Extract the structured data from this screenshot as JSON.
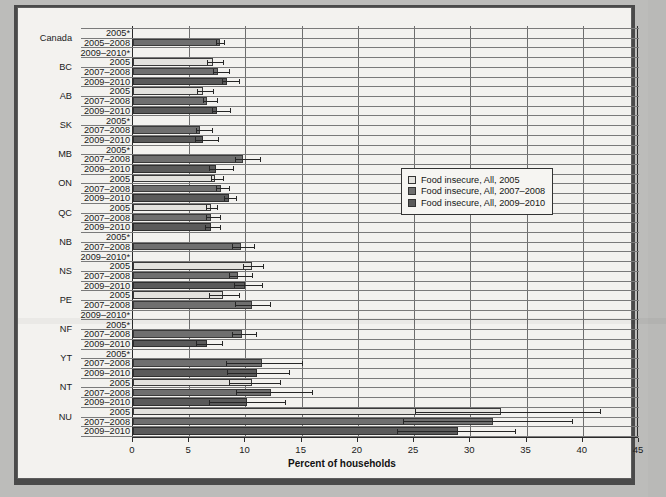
{
  "chart_data": {
    "type": "bar",
    "orientation": "horizontal",
    "title": "",
    "xlabel": "Percent of households",
    "ylabel": "",
    "xlim": [
      0,
      45
    ],
    "xticks": [
      0,
      5,
      10,
      15,
      20,
      25,
      30,
      35,
      40,
      45
    ],
    "grid": true,
    "legend_position": "upper right",
    "series": [
      {
        "name": "Food insecure, All, 2005",
        "color": "#e3e2de"
      },
      {
        "name": "Food insecure, All, 2007–2008",
        "color": "#6f6f6f"
      },
      {
        "name": "Food insecure, All, 2009–2010",
        "color": "#5a5a5a"
      }
    ],
    "note": "Rows marked with * have suppressed/unavailable estimates and show no bar.",
    "groups": [
      {
        "region": "Canada",
        "rows": [
          {
            "label": "2005*",
            "value": null,
            "ci_low": null,
            "ci_high": null,
            "series": 0
          },
          {
            "label": "2005–2008",
            "value": 7.7,
            "ci_low": 7.4,
            "ci_high": 8.1,
            "series": 1
          },
          {
            "label": "2009–2010*",
            "value": null,
            "ci_low": null,
            "ci_high": null,
            "series": 2
          }
        ]
      },
      {
        "region": "BC",
        "rows": [
          {
            "label": "2005",
            "value": 7.1,
            "ci_low": 6.6,
            "ci_high": 8.0,
            "series": 0
          },
          {
            "label": "2007–2008",
            "value": 7.6,
            "ci_low": 7.1,
            "ci_high": 8.5,
            "series": 1
          },
          {
            "label": "2009–2010",
            "value": 8.4,
            "ci_low": 7.9,
            "ci_high": 9.4,
            "series": 2
          }
        ]
      },
      {
        "region": "AB",
        "rows": [
          {
            "label": "2005",
            "value": 6.2,
            "ci_low": 5.7,
            "ci_high": 7.1,
            "series": 0
          },
          {
            "label": "2007–2008",
            "value": 6.6,
            "ci_low": 6.2,
            "ci_high": 7.5,
            "series": 1
          },
          {
            "label": "2009–2010",
            "value": 7.5,
            "ci_low": 7.0,
            "ci_high": 8.6,
            "series": 2
          }
        ]
      },
      {
        "region": "SK",
        "rows": [
          {
            "label": "2005*",
            "value": null,
            "ci_low": null,
            "ci_high": null,
            "series": 0
          },
          {
            "label": "2007–2008",
            "value": 6.0,
            "ci_low": 5.6,
            "ci_high": 7.0,
            "series": 1
          },
          {
            "label": "2009–2010",
            "value": 6.2,
            "ci_low": 5.5,
            "ci_high": 7.6,
            "series": 2
          }
        ]
      },
      {
        "region": "MB",
        "rows": [
          {
            "label": "2005*",
            "value": null,
            "ci_low": null,
            "ci_high": null,
            "series": 0
          },
          {
            "label": "2007–2008",
            "value": 9.8,
            "ci_low": 9.1,
            "ci_high": 11.3,
            "series": 1
          },
          {
            "label": "2009–2010",
            "value": 7.4,
            "ci_low": 6.8,
            "ci_high": 8.9,
            "series": 2
          }
        ]
      },
      {
        "region": "ON",
        "rows": [
          {
            "label": "2005",
            "value": 7.3,
            "ci_low": 6.9,
            "ci_high": 8.0,
            "series": 0
          },
          {
            "label": "2007–2008",
            "value": 7.8,
            "ci_low": 7.4,
            "ci_high": 8.5,
            "series": 1
          },
          {
            "label": "2009–2010",
            "value": 8.5,
            "ci_low": 8.1,
            "ci_high": 9.2,
            "series": 2
          }
        ]
      },
      {
        "region": "QC",
        "rows": [
          {
            "label": "2005",
            "value": 6.9,
            "ci_low": 6.5,
            "ci_high": 7.5,
            "series": 0
          },
          {
            "label": "2007–2008",
            "value": 6.9,
            "ci_low": 6.5,
            "ci_high": 7.7,
            "series": 1
          },
          {
            "label": "2009–2010",
            "value": 6.9,
            "ci_low": 6.4,
            "ci_high": 7.7,
            "series": 2
          }
        ]
      },
      {
        "region": "NB",
        "rows": [
          {
            "label": "2005*",
            "value": null,
            "ci_low": null,
            "ci_high": null,
            "series": 0
          },
          {
            "label": "2007–2008",
            "value": 9.6,
            "ci_low": 8.8,
            "ci_high": 10.8,
            "series": 1
          },
          {
            "label": "2009–2010*",
            "value": null,
            "ci_low": null,
            "ci_high": null,
            "series": 2
          }
        ]
      },
      {
        "region": "NS",
        "rows": [
          {
            "label": "2005",
            "value": 10.6,
            "ci_low": 9.8,
            "ci_high": 11.6,
            "series": 0
          },
          {
            "label": "2007–2008",
            "value": 9.3,
            "ci_low": 8.5,
            "ci_high": 10.6,
            "series": 1
          },
          {
            "label": "2009–2010",
            "value": 10.0,
            "ci_low": 9.0,
            "ci_high": 11.5,
            "series": 2
          }
        ]
      },
      {
        "region": "PE",
        "rows": [
          {
            "label": "2005",
            "value": 8.0,
            "ci_low": 6.8,
            "ci_high": 9.4,
            "series": 0
          },
          {
            "label": "2007–2008",
            "value": 10.6,
            "ci_low": 9.1,
            "ci_high": 12.2,
            "series": 1
          },
          {
            "label": "2009–2010*",
            "value": null,
            "ci_low": null,
            "ci_high": null,
            "series": 2
          }
        ]
      },
      {
        "region": "NF",
        "rows": [
          {
            "label": "2005*",
            "value": null,
            "ci_low": null,
            "ci_high": null,
            "series": 0
          },
          {
            "label": "2007–2008",
            "value": 9.7,
            "ci_low": 8.8,
            "ci_high": 10.9,
            "series": 1
          },
          {
            "label": "2009–2010",
            "value": 6.6,
            "ci_low": 5.6,
            "ci_high": 7.9,
            "series": 2
          }
        ]
      },
      {
        "region": "YT",
        "rows": [
          {
            "label": "2005*",
            "value": null,
            "ci_low": null,
            "ci_high": null,
            "series": 0
          },
          {
            "label": "2007–2008",
            "value": 11.5,
            "ci_low": 8.3,
            "ci_high": 15.0,
            "series": 1
          },
          {
            "label": "2009–2010",
            "value": 11.0,
            "ci_low": 8.4,
            "ci_high": 13.9,
            "series": 2
          }
        ]
      },
      {
        "region": "NT",
        "rows": [
          {
            "label": "2005",
            "value": 10.6,
            "ci_low": 8.5,
            "ci_high": 13.1,
            "series": 0
          },
          {
            "label": "2007–2008",
            "value": 12.3,
            "ci_low": 9.2,
            "ci_high": 15.9,
            "series": 1
          },
          {
            "label": "2009–2010",
            "value": 10.1,
            "ci_low": 6.8,
            "ci_high": 13.5,
            "series": 2
          }
        ]
      },
      {
        "region": "NU",
        "rows": [
          {
            "label": "2005",
            "value": 32.7,
            "ci_low": 25.1,
            "ci_high": 41.5,
            "series": 0
          },
          {
            "label": "2007–2008",
            "value": 32.0,
            "ci_low": 24.0,
            "ci_high": 39.0,
            "series": 1
          },
          {
            "label": "2009–2010",
            "value": 28.9,
            "ci_low": 23.5,
            "ci_high": 34.0,
            "series": 2
          }
        ]
      }
    ]
  }
}
